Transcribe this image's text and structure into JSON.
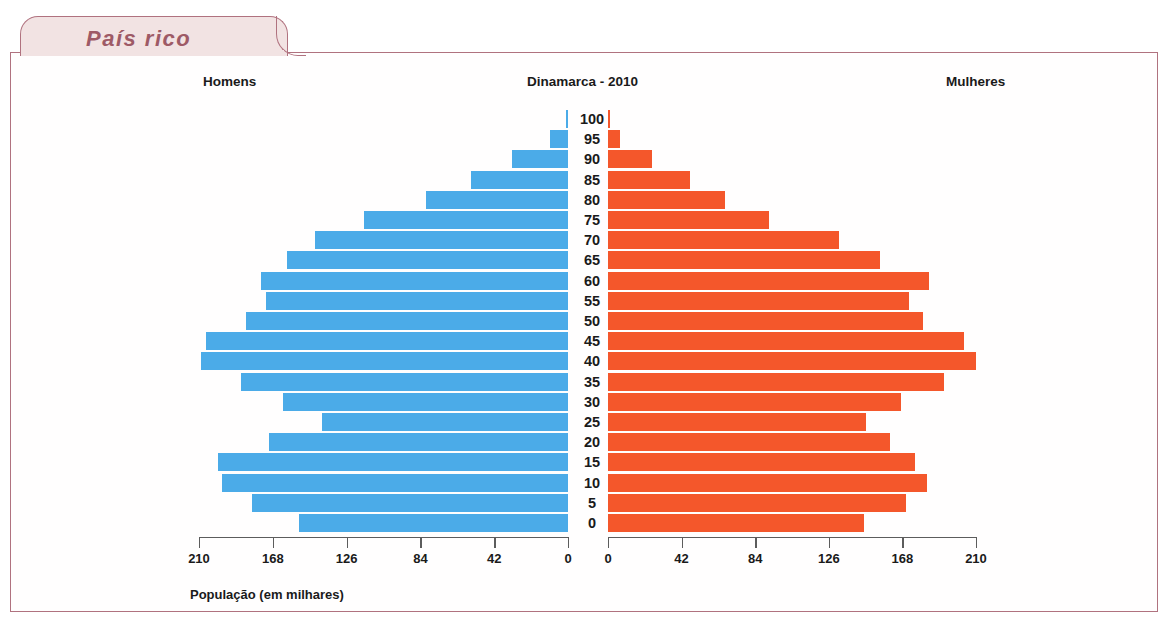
{
  "tab": {
    "label": "País rico"
  },
  "headers": {
    "men": "Homens",
    "title": "Dinamarca - 2010",
    "women": "Mulheres"
  },
  "axis_caption": "População (em milhares)",
  "colors": {
    "male_bar": "#4babe8",
    "female_bar": "#f4572b",
    "frame": "#b0727f",
    "tab_fill": "#f2e3e3",
    "tab_text": "#9e5a66",
    "axis": "#5c5c5c"
  },
  "axes": {
    "left_ticks": [
      "210",
      "168",
      "126",
      "84",
      "42",
      "0"
    ],
    "right_ticks": [
      "0",
      "42",
      "84",
      "126",
      "168",
      "210"
    ],
    "max": 210,
    "unit": "milhares"
  },
  "chart_data": {
    "type": "bar",
    "subtype": "population-pyramid",
    "title": "Dinamarca - 2010",
    "xlabel": "População (em milhares)",
    "ylabel": "Idade",
    "xlim": [
      0,
      210
    ],
    "grid": false,
    "categories": [
      "0",
      "5",
      "10",
      "15",
      "20",
      "25",
      "30",
      "35",
      "40",
      "45",
      "50",
      "55",
      "60",
      "65",
      "70",
      "75",
      "80",
      "85",
      "90",
      "95",
      "100"
    ],
    "series": [
      {
        "name": "Homens",
        "side": "left",
        "color": "#4babe8",
        "values": [
          153,
          180,
          197,
          199,
          170,
          140,
          162,
          186,
          209,
          206,
          183,
          172,
          175,
          160,
          144,
          116,
          81,
          55,
          32,
          10,
          1
        ]
      },
      {
        "name": "Mulheres",
        "side": "right",
        "color": "#f4572b",
        "values": [
          146,
          170,
          182,
          175,
          161,
          147,
          167,
          192,
          210,
          203,
          180,
          172,
          183,
          155,
          132,
          92,
          67,
          47,
          25,
          7,
          1
        ]
      }
    ],
    "legend": [
      "Homens",
      "Mulheres"
    ],
    "legend_position": "top"
  }
}
